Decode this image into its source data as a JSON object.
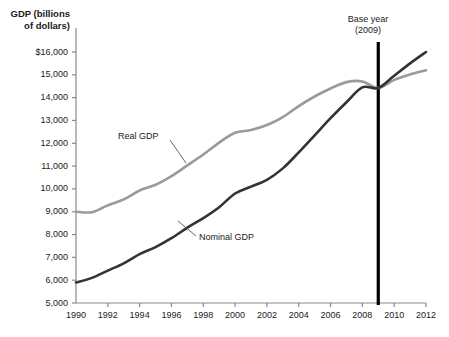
{
  "chart_data": {
    "type": "line",
    "title": "",
    "ylabel": "GDP (billions\nof dollars)",
    "xlabel": "",
    "ylim": [
      5000,
      16000
    ],
    "xlim": [
      1990,
      2012
    ],
    "grid": false,
    "legend": "inline-annotations",
    "ytick_labels": [
      "$16,000",
      "15,000",
      "14,000",
      "13,000",
      "12,000",
      "11,000",
      "10,000",
      "9,000",
      "8,000",
      "7,000",
      "6,000",
      "5,000"
    ],
    "ytick_values": [
      16000,
      15000,
      14000,
      13000,
      12000,
      11000,
      10000,
      9000,
      8000,
      7000,
      6000,
      5000
    ],
    "xtick_labels": [
      "1990",
      "1992",
      "1994",
      "1996",
      "1998",
      "2000",
      "2002",
      "2004",
      "2006",
      "2008",
      "2010",
      "2012"
    ],
    "xtick_values": [
      1990,
      1992,
      1994,
      1996,
      1998,
      2000,
      2002,
      2004,
      2006,
      2008,
      2010,
      2012
    ],
    "x": [
      1990,
      1991,
      1992,
      1993,
      1994,
      1995,
      1996,
      1997,
      1998,
      1999,
      2000,
      2001,
      2002,
      2003,
      2004,
      2005,
      2006,
      2007,
      2008,
      2009,
      2010,
      2011,
      2012
    ],
    "series": [
      {
        "name": "Real GDP",
        "color": "#9a9a9a",
        "values": [
          9000,
          8980,
          9280,
          9540,
          9930,
          10180,
          10560,
          11030,
          11510,
          12030,
          12460,
          12580,
          12800,
          13150,
          13630,
          14050,
          14400,
          14680,
          14710,
          14420,
          14780,
          15020,
          15200
        ]
      },
      {
        "name": "Nominal GDP",
        "color": "#333333",
        "values": [
          5900,
          6100,
          6420,
          6740,
          7140,
          7450,
          7840,
          8300,
          8720,
          9200,
          9800,
          10100,
          10400,
          10900,
          11600,
          12350,
          13100,
          13800,
          14450,
          14420,
          14960,
          15500,
          16000
        ]
      }
    ],
    "annotations": [
      {
        "name": "base-year",
        "text": "Base year\n(2009)",
        "x": 2009,
        "line_color": "#000000"
      }
    ]
  }
}
